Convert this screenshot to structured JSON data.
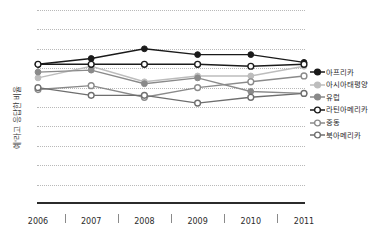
{
  "chart_data": {
    "type": "line",
    "title": "",
    "xlabel": "",
    "ylabel": "예'라고 응답한 비율",
    "categories": [
      "2006",
      "2007",
      "2008",
      "2009",
      "2010",
      "2011"
    ],
    "ylim": [
      0,
      100
    ],
    "yticks": [
      "0",
      "10",
      "20",
      "30",
      "40",
      "50",
      "60",
      "70",
      "80",
      "90",
      "100"
    ],
    "grid": true,
    "legend_position": "right",
    "series": [
      {
        "name": "아프리카",
        "color": "#1a1a1a",
        "marker": "filled-circle",
        "values": [
          72,
          75,
          80,
          77,
          77,
          73
        ]
      },
      {
        "name": "아시아태평양",
        "color": "#bdbdbd",
        "marker": "filled-circle",
        "values": [
          65,
          71,
          63,
          66,
          66,
          71
        ]
      },
      {
        "name": "유럽",
        "color": "#8a8a8a",
        "marker": "filled-circle",
        "values": [
          68,
          69,
          62,
          65,
          58,
          57
        ]
      },
      {
        "name": "라틴아메리카",
        "color": "#1a1a1a",
        "marker": "open-circle",
        "values": [
          72,
          72,
          72,
          72,
          71,
          72
        ]
      },
      {
        "name": "중동",
        "color": "#8a8a8a",
        "marker": "open-circle",
        "values": [
          59,
          61,
          55,
          60,
          63,
          66
        ]
      },
      {
        "name": "북아메리카",
        "color": "#6e6e6e",
        "marker": "open-circle",
        "values": [
          60,
          56,
          56,
          52,
          55,
          57
        ]
      }
    ]
  }
}
